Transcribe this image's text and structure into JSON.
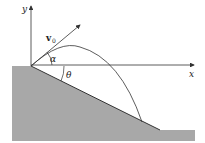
{
  "diagram": {
    "labels": {
      "y_axis": "y",
      "x_axis": "x",
      "velocity": "v",
      "velocity_subscript": "0",
      "launch_angle": "α",
      "slope_angle": "θ"
    },
    "colors": {
      "ground": "#a8a8a8",
      "line": "#333333",
      "background": "#ffffff"
    }
  }
}
